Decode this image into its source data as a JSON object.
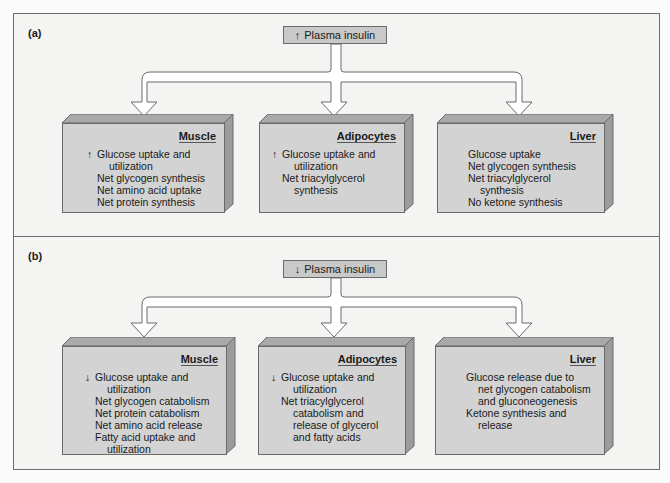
{
  "panels": [
    {
      "label": "(a)",
      "insulin": {
        "arrow": "↑",
        "text": "Plasma insulin"
      },
      "tissues": [
        {
          "title": "Muscle",
          "lines": [
            {
              "arrow": "↑",
              "text": "Glucose uptake and"
            },
            {
              "indent": true,
              "text": "utilization"
            },
            {
              "text": "Net glycogen synthesis"
            },
            {
              "text": "Net amino acid uptake"
            },
            {
              "text": "Net protein synthesis"
            }
          ]
        },
        {
          "title": "Adipocytes",
          "lines": [
            {
              "arrow": "↑",
              "text": "Glucose uptake and"
            },
            {
              "indent": true,
              "text": "utilization"
            },
            {
              "text": "Net triacylglycerol"
            },
            {
              "indent": true,
              "text": "synthesis"
            }
          ]
        },
        {
          "title": "Liver",
          "lines": [
            {
              "text": "Glucose uptake"
            },
            {
              "text": "Net glycogen synthesis"
            },
            {
              "text": "Net triacylglycerol"
            },
            {
              "indent": true,
              "text": "synthesis"
            },
            {
              "text": "No ketone synthesis"
            }
          ]
        }
      ]
    },
    {
      "label": "(b)",
      "insulin": {
        "arrow": "↓",
        "text": "Plasma insulin"
      },
      "tissues": [
        {
          "title": "Muscle",
          "lines": [
            {
              "arrow": "↓",
              "text": "Glucose uptake and"
            },
            {
              "indent": true,
              "text": "utilization"
            },
            {
              "text": "Net glycogen catabolism"
            },
            {
              "text": "Net protein catabolism"
            },
            {
              "text": "Net amino acid release"
            },
            {
              "text": "Fatty acid uptake and"
            },
            {
              "indent": true,
              "text": "utilization"
            }
          ]
        },
        {
          "title": "Adipocytes",
          "lines": [
            {
              "arrow": "↓",
              "text": "Glucose uptake and"
            },
            {
              "indent": true,
              "text": "utilization"
            },
            {
              "text": "Net triacylglycerol"
            },
            {
              "indent": true,
              "text": "catabolism and"
            },
            {
              "indent": true,
              "text": "release of glycerol"
            },
            {
              "indent": true,
              "text": "and fatty acids"
            }
          ]
        },
        {
          "title": "Liver",
          "lines": [
            {
              "text": "Glucose release due to"
            },
            {
              "indent": true,
              "text": "net glycogen catabolism"
            },
            {
              "indent": true,
              "text": "and gluconeogenesis"
            },
            {
              "text": "Ketone synthesis and"
            },
            {
              "indent": true,
              "text": "release"
            }
          ]
        }
      ]
    }
  ],
  "colors": {
    "panel_bg": "#f4f4f2",
    "box_front": "#d3d3d3",
    "box_top": "#a9a9a9",
    "box_side": "#9c9c9c",
    "border": "#6a6a6a"
  }
}
